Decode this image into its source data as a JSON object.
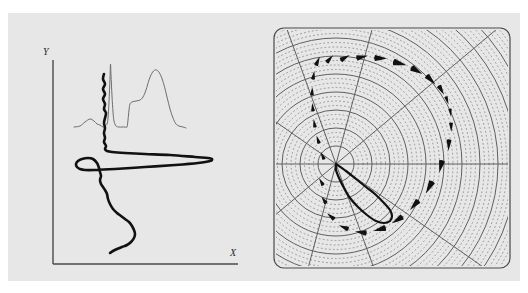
{
  "figure": {
    "background": "#ffffff",
    "plate_background": "#e7e7e7",
    "width": 528,
    "height": 293,
    "panel_count": 2
  },
  "left_panel": {
    "name": "cartesian-panel",
    "axes": {
      "x_label": "X",
      "y_label": "Y",
      "x_label_pos": [
        230,
        256
      ],
      "y_label_pos": [
        43,
        55
      ],
      "axis_color": "#4a4a4a",
      "origin": [
        53,
        264
      ],
      "x_axis_end": [
        238,
        264
      ],
      "y_axis_top": [
        53,
        60
      ]
    },
    "curves": [
      {
        "name": "thin-spectrum-curve",
        "role": "reference spectrum",
        "color": "#6e6e6e",
        "stroke_width": 1.0,
        "style": "solid",
        "description": "light trace with a small bump at left, a very tall narrow spike near x=110, a shoulder plateau, and a broad rounded peak near x=155",
        "points": [
          [
            74,
            127
          ],
          [
            80,
            126
          ],
          [
            85,
            122
          ],
          [
            90,
            119
          ],
          [
            94,
            121
          ],
          [
            97,
            124
          ],
          [
            100,
            125
          ],
          [
            103,
            127
          ],
          [
            105,
            126
          ],
          [
            107,
            124
          ],
          [
            108,
            118
          ],
          [
            109,
            102
          ],
          [
            110,
            78
          ],
          [
            110.5,
            64
          ],
          [
            111,
            75
          ],
          [
            112,
            96
          ],
          [
            113,
            112
          ],
          [
            114,
            121
          ],
          [
            116,
            126
          ],
          [
            119,
            127
          ],
          [
            122,
            127
          ],
          [
            125,
            127
          ],
          [
            127,
            127
          ],
          [
            128,
            120
          ],
          [
            129,
            110
          ],
          [
            130,
            104
          ],
          [
            132,
            102
          ],
          [
            136,
            101
          ],
          [
            140,
            100
          ],
          [
            143,
            97
          ],
          [
            146,
            90
          ],
          [
            149,
            80
          ],
          [
            152,
            73
          ],
          [
            155,
            70
          ],
          [
            158,
            71
          ],
          [
            161,
            76
          ],
          [
            164,
            85
          ],
          [
            167,
            97
          ],
          [
            170,
            109
          ],
          [
            173,
            118
          ],
          [
            176,
            124
          ],
          [
            179,
            126
          ],
          [
            183,
            127
          ],
          [
            186,
            128
          ]
        ]
      },
      {
        "name": "thick-response-curve",
        "role": "main response curve",
        "color": "#111111",
        "stroke_width": 2.6,
        "style": "solid",
        "description": "heavy oscillating trace: jagged wiggles descending from top, a sharp wide horizontal excursion to the right, a deep leftward swing, then a smooth S descent to the bottom",
        "points": [
          [
            104,
            74
          ],
          [
            103,
            79
          ],
          [
            105,
            84
          ],
          [
            103,
            89
          ],
          [
            105,
            94
          ],
          [
            103,
            99
          ],
          [
            105,
            104
          ],
          [
            104,
            109
          ],
          [
            106,
            113
          ],
          [
            105,
            118
          ],
          [
            104,
            123
          ],
          [
            105,
            128
          ],
          [
            104,
            133
          ],
          [
            105,
            138
          ],
          [
            104,
            142
          ],
          [
            106,
            146
          ],
          [
            105,
            149
          ],
          [
            107,
            151
          ],
          [
            112,
            152
          ],
          [
            125,
            153
          ],
          [
            145,
            154
          ],
          [
            170,
            155
          ],
          [
            195,
            157
          ],
          [
            208,
            158
          ],
          [
            212,
            159
          ],
          [
            210,
            161
          ],
          [
            198,
            163
          ],
          [
            175,
            165
          ],
          [
            145,
            167
          ],
          [
            115,
            169
          ],
          [
            95,
            170
          ],
          [
            85,
            170
          ],
          [
            80,
            169
          ],
          [
            77,
            167
          ],
          [
            76,
            164
          ],
          [
            78,
            161
          ],
          [
            82,
            159
          ],
          [
            88,
            158
          ],
          [
            93,
            159
          ],
          [
            97,
            163
          ],
          [
            99,
            168
          ],
          [
            100,
            172
          ],
          [
            101,
            176
          ],
          [
            100,
            180
          ],
          [
            101,
            184
          ],
          [
            103,
            187
          ],
          [
            105,
            190
          ],
          [
            107,
            194
          ],
          [
            108,
            199
          ],
          [
            110,
            204
          ],
          [
            113,
            209
          ],
          [
            117,
            213
          ],
          [
            121,
            216
          ],
          [
            125,
            219
          ],
          [
            129,
            222
          ],
          [
            132,
            226
          ],
          [
            134,
            230
          ],
          [
            135,
            234
          ],
          [
            134,
            238
          ],
          [
            131,
            242
          ],
          [
            127,
            245
          ],
          [
            122,
            247
          ],
          [
            117,
            249
          ],
          [
            113,
            251
          ],
          [
            110,
            253
          ]
        ]
      }
    ]
  },
  "right_panel": {
    "name": "polar-panel",
    "frame": {
      "shape": "rounded-rect",
      "color": "#4a4a4a",
      "stroke_width": 1.2,
      "radius": 10,
      "x": 8,
      "y": 15,
      "width": 236,
      "height": 240
    },
    "polar_grid": {
      "center": [
        70,
        151
      ],
      "solid_ring_color": "#5f5f5f",
      "dotted_ring_color": "#8a8a8a",
      "spoke_color": "#5f5f5f",
      "solid_ring_radii": [
        18,
        36,
        54,
        72,
        90,
        108,
        126,
        144,
        162,
        180,
        198
      ],
      "dotted_rings_between": 3,
      "spoke_angles_deg": [
        0,
        35,
        70,
        105,
        140,
        180,
        215,
        250,
        285,
        320
      ],
      "description": "concentric solid circles with three dotted circles between each pair, plus straight radial spokes"
    },
    "curves": [
      {
        "name": "dashed-comet-curve",
        "role": "tapered dash trajectory",
        "color": "#111111",
        "style": "tapered-dashes",
        "description": "large open arc of comet-shaped tapered dashes sweeping from upper-left around the right side to the lower-left, widest at right",
        "dashes": [
          {
            "x": 50,
            "y": 52,
            "angle": -65,
            "len": 9,
            "w": 4.5
          },
          {
            "x": 47,
            "y": 66,
            "angle": -80,
            "len": 8,
            "w": 4.0
          },
          {
            "x": 46,
            "y": 82,
            "angle": -88,
            "len": 8,
            "w": 3.8
          },
          {
            "x": 47,
            "y": 98,
            "angle": -95,
            "len": 8,
            "w": 3.8
          },
          {
            "x": 49,
            "y": 114,
            "angle": -100,
            "len": 8,
            "w": 3.8
          },
          {
            "x": 53,
            "y": 130,
            "angle": -108,
            "len": 8,
            "w": 3.8
          },
          {
            "x": 58,
            "y": 146,
            "angle": -115,
            "len": 8,
            "w": 3.8
          },
          {
            "x": 57,
            "y": 172,
            "angle": -120,
            "len": 8,
            "w": 3.8
          },
          {
            "x": 60,
            "y": 190,
            "angle": -125,
            "len": 8,
            "w": 4.0
          },
          {
            "x": 68,
            "y": 206,
            "angle": -140,
            "len": 9,
            "w": 4.5
          },
          {
            "x": 82,
            "y": 216,
            "angle": -158,
            "len": 10,
            "w": 5.0
          },
          {
            "x": 100,
            "y": 220,
            "angle": -172,
            "len": 11,
            "w": 5.5
          },
          {
            "x": 119,
            "y": 215,
            "angle": 165,
            "len": 12,
            "w": 6.0
          },
          {
            "x": 136,
            "y": 204,
            "angle": 148,
            "len": 12,
            "w": 6.0
          },
          {
            "x": 152,
            "y": 188,
            "angle": 132,
            "len": 12,
            "w": 6.0
          },
          {
            "x": 166,
            "y": 169,
            "angle": 118,
            "len": 13,
            "w": 6.5
          },
          {
            "x": 176,
            "y": 148,
            "angle": 103,
            "len": 12,
            "w": 6.0
          },
          {
            "x": 183,
            "y": 127,
            "angle": 93,
            "len": 11,
            "w": 5.0
          },
          {
            "x": 185,
            "y": 110,
            "angle": 88,
            "len": 9,
            "w": 4.0
          },
          {
            "x": 184,
            "y": 96,
            "angle": 82,
            "len": 8,
            "w": 3.5
          },
          {
            "x": 180,
            "y": 84,
            "angle": 72,
            "len": 8,
            "w": 3.5
          },
          {
            "x": 173,
            "y": 73,
            "angle": 60,
            "len": 10,
            "w": 5.0
          },
          {
            "x": 161,
            "y": 63,
            "angle": 45,
            "len": 12,
            "w": 6.0
          },
          {
            "x": 146,
            "y": 55,
            "angle": 30,
            "len": 12,
            "w": 6.5
          },
          {
            "x": 128,
            "y": 49,
            "angle": 15,
            "len": 13,
            "w": 6.5
          },
          {
            "x": 109,
            "y": 45,
            "angle": 2,
            "len": 12,
            "w": 6.0
          },
          {
            "x": 91,
            "y": 45,
            "angle": -12,
            "len": 11,
            "w": 5.5
          },
          {
            "x": 75,
            "y": 47,
            "angle": -30,
            "len": 10,
            "w": 5.0
          },
          {
            "x": 61,
            "y": 49,
            "angle": -48,
            "len": 9,
            "w": 4.5
          }
        ]
      },
      {
        "name": "solid-teardrop-loop",
        "role": "inner solid loop",
        "color": "#111111",
        "stroke_width": 2.2,
        "style": "solid",
        "description": "small narrow teardrop loop starting at the polar centre and extending down-right, closing back on itself",
        "points": [
          [
            70,
            151
          ],
          [
            80,
            158
          ],
          [
            90,
            166
          ],
          [
            100,
            174
          ],
          [
            110,
            182
          ],
          [
            118,
            190
          ],
          [
            124,
            197
          ],
          [
            126,
            203
          ],
          [
            124,
            208
          ],
          [
            118,
            210
          ],
          [
            110,
            208
          ],
          [
            101,
            202
          ],
          [
            92,
            194
          ],
          [
            84,
            185
          ],
          [
            78,
            175
          ],
          [
            73,
            165
          ],
          [
            70,
            157
          ],
          [
            70,
            151
          ]
        ]
      }
    ]
  }
}
